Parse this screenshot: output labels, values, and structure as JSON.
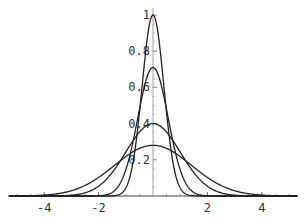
{
  "chart_data": {
    "type": "line",
    "title": "",
    "xlabel": "",
    "ylabel": "",
    "xlim": [
      -5.6,
      5.6
    ],
    "ylim": [
      0,
      1.0
    ],
    "grid": false,
    "legend": "none",
    "x_ticks": [
      -4,
      -2,
      2,
      4
    ],
    "x_tick_labels": [
      "-4",
      "-2",
      "2",
      "4"
    ],
    "y_ticks": [
      0.2,
      0.4,
      0.6,
      0.8,
      1
    ],
    "y_tick_labels": [
      "0.2",
      "0.4",
      "0.6",
      "0.8",
      "1"
    ],
    "series": [
      {
        "name": "normal density sigma=0.4",
        "peak": 1.0,
        "sigma": 0.4
      },
      {
        "name": "normal density sigma=0.56",
        "peak": 0.71,
        "sigma": 0.56
      },
      {
        "name": "normal density sigma=1",
        "peak": 0.4,
        "sigma": 1.0
      },
      {
        "name": "normal density sigma=1.41",
        "peak": 0.28,
        "sigma": 1.41
      }
    ],
    "line_color": "#222222"
  }
}
